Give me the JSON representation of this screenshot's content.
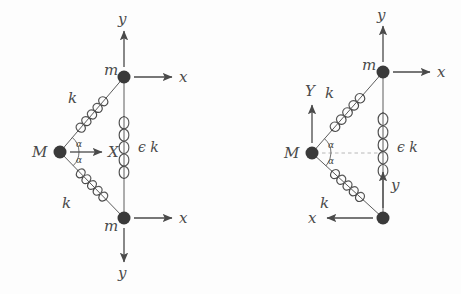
{
  "figure": {
    "type": "physics-diagram",
    "background_color": "#fdfdfd",
    "stroke_color": "#4a4a4a",
    "node_fill_color": "#3a3a3a",
    "dashed_color": "#b0b0b0"
  },
  "panels": [
    {
      "id": "left-panel",
      "name": "symmetric-configuration",
      "nodes": [
        {
          "id": "M",
          "label": "M",
          "x": 60,
          "y": 152,
          "r": 6.5,
          "label_x": 32,
          "label_y": 145
        },
        {
          "id": "m_top",
          "label": "m",
          "x": 124,
          "y": 77,
          "r": 6.5,
          "label_x": 104,
          "label_y": 63
        },
        {
          "id": "m_bot",
          "label": "m",
          "x": 124,
          "y": 218,
          "r": 6.5,
          "label_x": 104,
          "label_y": 219
        }
      ],
      "springs": [
        {
          "id": "k_top",
          "label": "k",
          "from": "M",
          "to": "m_top",
          "label_x": 68,
          "label_y": 91,
          "coils": 5
        },
        {
          "id": "k_bot",
          "label": "k",
          "from": "M",
          "to": "m_bot",
          "label_x": 62,
          "label_y": 196,
          "coils": 5
        },
        {
          "id": "eps_k",
          "label": "ϵ k",
          "from": "m_top",
          "to": "m_bot",
          "label_x": 138,
          "label_y": 140,
          "coils": 5
        }
      ],
      "angles": [
        {
          "id": "alpha_upper",
          "label": "α",
          "label_x": 76,
          "label_y": 140
        },
        {
          "id": "alpha_lower",
          "label": "α",
          "label_x": 76,
          "label_y": 156
        }
      ],
      "arrows": [
        {
          "id": "X-arrow",
          "label": "X",
          "direction": "right",
          "from_x": 70,
          "from_y": 152,
          "to_x": 102,
          "to_y": 152,
          "label_x": 108,
          "label_y": 145
        },
        {
          "id": "top-x-arrow",
          "label": "x",
          "direction": "right",
          "from_x": 134,
          "from_y": 77,
          "to_x": 172,
          "to_y": 77,
          "label_x": 179,
          "label_y": 70
        },
        {
          "id": "top-y-arrow",
          "label": "y",
          "direction": "up",
          "from_x": 124,
          "from_y": 67,
          "to_x": 124,
          "to_y": 31,
          "label_x": 118,
          "label_y": 12
        },
        {
          "id": "bottom-x-arrow",
          "label": "x",
          "direction": "right",
          "from_x": 134,
          "from_y": 218,
          "to_x": 172,
          "to_y": 218,
          "label_x": 179,
          "label_y": 211
        },
        {
          "id": "bottom-y-arrow",
          "label": "y",
          "direction": "down",
          "from_x": 124,
          "from_y": 228,
          "to_x": 124,
          "to_y": 262,
          "label_x": 118,
          "label_y": 266
        }
      ]
    },
    {
      "id": "right-panel",
      "name": "antisymmetric-configuration",
      "nodes": [
        {
          "id": "M",
          "label": "M",
          "x": 312,
          "y": 153,
          "r": 6.5,
          "label_x": 284,
          "label_y": 146
        },
        {
          "id": "m_top",
          "label": "m",
          "x": 383,
          "y": 72,
          "r": 6.5,
          "label_x": 362,
          "label_y": 58
        },
        {
          "id": "m_bot",
          "label": "",
          "x": 383,
          "y": 218,
          "r": 6.5,
          "label_x": 0,
          "label_y": 0
        }
      ],
      "springs": [
        {
          "id": "k_top",
          "label": "k",
          "from": "M",
          "to": "m_top",
          "label_x": 325,
          "label_y": 86,
          "coils": 5
        },
        {
          "id": "k_bot",
          "label": "k",
          "from": "M",
          "to": "m_bot",
          "label_x": 320,
          "label_y": 196,
          "coils": 5
        },
        {
          "id": "eps_k",
          "label": "ϵ k",
          "from": "m_top",
          "to": "m_bot",
          "label_x": 397,
          "label_y": 140,
          "coils": 5
        }
      ],
      "angles": [
        {
          "id": "alpha_upper",
          "label": "α",
          "label_x": 328,
          "label_y": 141
        },
        {
          "id": "alpha_lower",
          "label": "α",
          "label_x": 328,
          "label_y": 157
        }
      ],
      "dashed_line": {
        "id": "axis-dashed",
        "from_x": 322,
        "from_y": 153,
        "to_x": 383,
        "to_y": 153
      },
      "arrows": [
        {
          "id": "Y-arrow",
          "label": "Y",
          "direction": "up",
          "from_x": 312,
          "from_y": 143,
          "to_x": 312,
          "to_y": 105,
          "label_x": 305,
          "label_y": 84
        },
        {
          "id": "top-x-arrow",
          "label": "x",
          "direction": "right",
          "from_x": 393,
          "from_y": 72,
          "to_x": 430,
          "to_y": 72,
          "label_x": 437,
          "label_y": 65
        },
        {
          "id": "top-y-arrow",
          "label": "y",
          "direction": "up",
          "from_x": 383,
          "from_y": 62,
          "to_x": 383,
          "to_y": 26,
          "label_x": 377,
          "label_y": 8
        },
        {
          "id": "bottom-x-arrow",
          "label": "x",
          "direction": "left",
          "from_x": 373,
          "from_y": 218,
          "to_x": 327,
          "to_y": 218,
          "label_x": 308,
          "label_y": 211
        },
        {
          "id": "bottom-y-arrow",
          "label": "y",
          "direction": "up",
          "from_x": 383,
          "from_y": 208,
          "to_x": 383,
          "to_y": 172,
          "label_x": 391,
          "label_y": 178
        }
      ]
    }
  ]
}
